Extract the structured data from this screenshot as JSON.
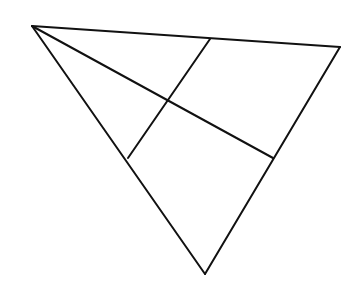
{
  "canvas": {
    "width": 362,
    "height": 287,
    "background": "#ffffff"
  },
  "style": {
    "stroke": "#111111",
    "stroke_width": 2
  },
  "points": {
    "A": [
      32,
      26
    ],
    "B": [
      340,
      47
    ],
    "C": [
      205,
      274
    ],
    "P": [
      210,
      39
    ],
    "Q": [
      273,
      158
    ],
    "R": [
      128,
      158
    ]
  },
  "segments": [
    {
      "name": "side-ab",
      "from": "A",
      "to": "B"
    },
    {
      "name": "side-bc",
      "from": "B",
      "to": "C"
    },
    {
      "name": "side-ca",
      "from": "C",
      "to": "A"
    },
    {
      "name": "segment-aq",
      "from": "A",
      "to": "Q"
    },
    {
      "name": "segment-pr",
      "from": "P",
      "to": "R"
    }
  ],
  "labels": []
}
